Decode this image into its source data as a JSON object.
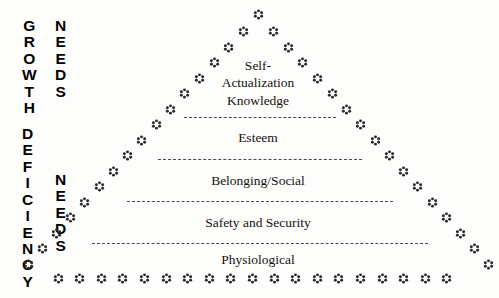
{
  "diagram": {
    "background_color": "#fdfdfc",
    "ink_color": "#15120f",
    "decoration_color": "#2a2a2a",
    "divider_color": "#4a4a4a"
  },
  "side_labels": {
    "growth": {
      "category": "GROWTH",
      "needs": "NEEDS"
    },
    "deficiency": {
      "category": "DEFICIENCY",
      "needs": "NEEDS"
    }
  },
  "tiers": [
    {
      "index": 0,
      "name": "self-actualization",
      "lines": [
        "Self-",
        "Actualization",
        "Knowledge"
      ],
      "caption": "Self- Actualization Knowledge",
      "center_x": 258,
      "text_top": 57,
      "group": "growth"
    },
    {
      "index": 1,
      "name": "esteem",
      "lines": [
        "Esteem"
      ],
      "caption": "Esteem",
      "center_x": 258,
      "text_top": 130,
      "group": "deficiency"
    },
    {
      "index": 2,
      "name": "belonging-social",
      "lines": [
        "Belonging/Social"
      ],
      "caption": "Belonging/Social",
      "center_x": 258,
      "text_top": 173,
      "group": "deficiency"
    },
    {
      "index": 3,
      "name": "safety-and-security",
      "lines": [
        "Safety and Security"
      ],
      "caption": "Safety and Security",
      "center_x": 258,
      "text_top": 215,
      "group": "deficiency"
    },
    {
      "index": 4,
      "name": "physiological",
      "lines": [
        "Physiological"
      ],
      "caption": "Physiological",
      "center_x": 258,
      "text_top": 252,
      "group": "deficiency"
    }
  ],
  "dividers": [
    {
      "name": "divider-self-actualization-esteem",
      "x": 184,
      "y": 117,
      "width": 152
    },
    {
      "name": "divider-esteem-belonging",
      "x": 158,
      "y": 159,
      "width": 204
    },
    {
      "name": "divider-belonging-safety",
      "x": 127,
      "y": 201,
      "width": 266
    },
    {
      "name": "divider-safety-physiological",
      "x": 92,
      "y": 243,
      "width": 336
    }
  ],
  "decorations": {
    "glyph_name": "flower-asterisk",
    "apex": {
      "x": 258,
      "y": 14
    },
    "left_edge": [
      [
        243,
        31
      ],
      [
        228,
        47
      ],
      [
        214,
        62
      ],
      [
        199,
        78
      ],
      [
        184,
        93
      ],
      [
        170,
        109
      ],
      [
        156,
        124
      ],
      [
        141,
        140
      ],
      [
        127,
        155
      ],
      [
        113,
        171
      ],
      [
        99,
        186
      ],
      [
        84,
        202
      ],
      [
        70,
        217
      ],
      [
        56,
        233
      ],
      [
        42,
        248
      ],
      [
        28,
        264
      ]
    ],
    "right_edge": [
      [
        273,
        31
      ],
      [
        288,
        47
      ],
      [
        302,
        62
      ],
      [
        317,
        78
      ],
      [
        332,
        93
      ],
      [
        346,
        109
      ],
      [
        360,
        124
      ],
      [
        375,
        140
      ],
      [
        389,
        155
      ],
      [
        403,
        171
      ],
      [
        417,
        186
      ],
      [
        432,
        202
      ],
      [
        446,
        217
      ],
      [
        460,
        233
      ],
      [
        474,
        248
      ],
      [
        488,
        264
      ]
    ],
    "base_row": {
      "y": 278,
      "start_x": 58,
      "spacing": 21.6,
      "count": 19
    }
  }
}
